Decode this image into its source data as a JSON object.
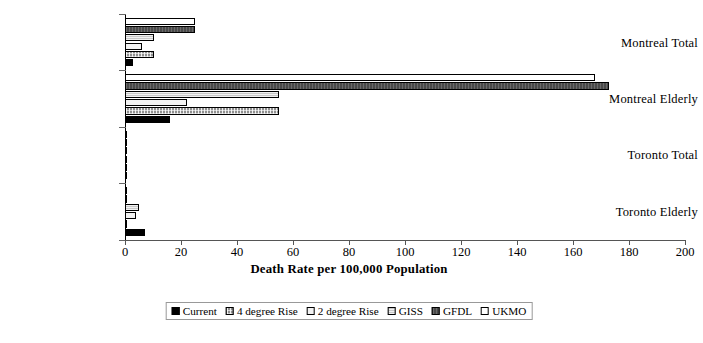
{
  "chart_data": {
    "type": "bar",
    "orientation": "horizontal",
    "title": "",
    "xlabel": "Death Rate per 100,000 Population",
    "ylabel": "",
    "xlim": [
      0,
      200
    ],
    "xticks": [
      0,
      20,
      40,
      60,
      80,
      100,
      120,
      140,
      160,
      180,
      200
    ],
    "grid": false,
    "legend_position": "bottom",
    "categories": [
      "Montreal Total",
      "Montreal Elderly",
      "Toronto Total",
      "Toronto Elderly"
    ],
    "series": [
      {
        "name": "Current",
        "color": "#000000",
        "values": [
          3,
          16,
          0.5,
          7
        ]
      },
      {
        "name": "4 degree Rise",
        "color": "#8f8f8f",
        "values": [
          10.5,
          55,
          0.3,
          0
        ]
      },
      {
        "name": "2 degree Rise",
        "color": "#f2f2f2",
        "values": [
          6,
          22,
          0.3,
          4
        ]
      },
      {
        "name": "GISS",
        "color": "#c8c8c8",
        "values": [
          10.5,
          55,
          0.3,
          5
        ]
      },
      {
        "name": "GFDL",
        "color": "#4a4a4a",
        "values": [
          25,
          173,
          0.3,
          0
        ]
      },
      {
        "name": "UKMO",
        "color": "#ffffff",
        "values": [
          25,
          168,
          0.3,
          0
        ]
      }
    ]
  },
  "legend": {
    "items": [
      {
        "label": "Current"
      },
      {
        "label": "4 degree Rise"
      },
      {
        "label": "2 degree Rise"
      },
      {
        "label": "GISS"
      },
      {
        "label": "GFDL"
      },
      {
        "label": "UKMO"
      }
    ]
  }
}
